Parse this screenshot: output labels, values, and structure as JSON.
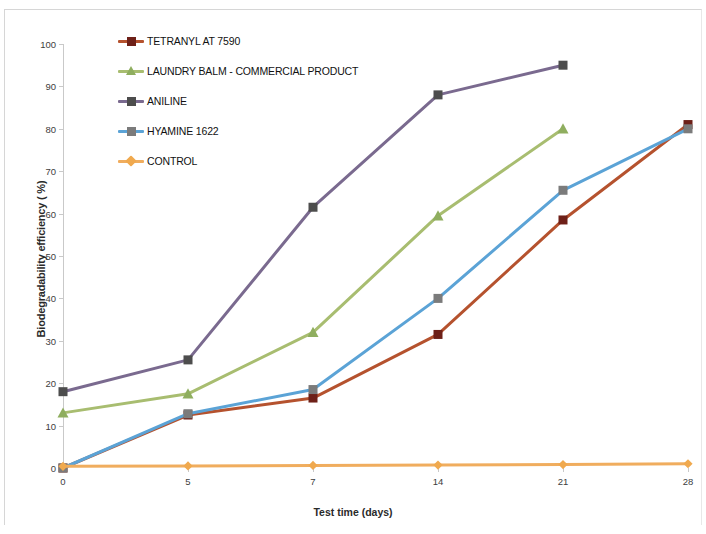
{
  "chart_data": {
    "type": "line",
    "title": "",
    "xlabel": "Test time (days)",
    "ylabel": "Biodegradability efficiency ( %)",
    "categories": [
      "0",
      "5",
      "7",
      "14",
      "21",
      "28"
    ],
    "x": [
      0,
      5,
      7,
      14,
      21,
      28
    ],
    "ylim": [
      0,
      100
    ],
    "ytick_labels": [
      "0",
      "10",
      "20",
      "30",
      "40",
      "50",
      "60",
      "70",
      "80",
      "90",
      "100"
    ],
    "yticks": [
      0,
      10,
      20,
      30,
      40,
      50,
      60,
      70,
      80,
      90,
      100
    ],
    "grid": false,
    "legend_position": "top-left-inside",
    "series": [
      {
        "name": "TETRANYL AT 7590",
        "color": "#b5522e",
        "marker": "square",
        "marker_color": "#6e2018",
        "values": [
          0,
          12.5,
          16.5,
          31.5,
          58.5,
          81
        ]
      },
      {
        "name": "LAUNDRY BALM - COMMERCIAL PRODUCT",
        "color": "#a8bd70",
        "marker": "triangle",
        "marker_color": "#8fae5f",
        "values": [
          13,
          17.5,
          32,
          59.5,
          80,
          null
        ]
      },
      {
        "name": "ANILINE",
        "color": "#7a6a8f",
        "marker": "square",
        "marker_color": "#4d4d4d",
        "values": [
          18,
          25.5,
          61.5,
          88,
          95,
          null
        ]
      },
      {
        "name": "HYAMINE 1622",
        "color": "#5ba3d6",
        "marker": "square",
        "marker_color": "#7b7b7b",
        "values": [
          0,
          12.8,
          18.5,
          40,
          65.5,
          80
        ]
      },
      {
        "name": "CONTROL",
        "color": "#f0ad5e",
        "marker": "diamond",
        "marker_color": "#f0a94e",
        "values": [
          0.4,
          0.5,
          0.6,
          0.7,
          0.8,
          1
        ]
      }
    ]
  }
}
